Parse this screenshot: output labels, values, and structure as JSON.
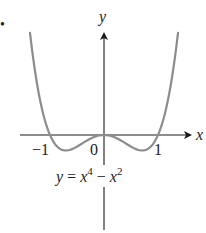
{
  "chart_data": {
    "type": "line",
    "title": "",
    "equation": "y = x^4 − x^2",
    "xlabel": "x",
    "ylabel": "y",
    "x_ticks": [
      "-1",
      "0",
      "1"
    ],
    "xlim": [
      -1.55,
      1.6
    ],
    "ylim": [
      -1.55,
      1.65
    ],
    "grid": false,
    "legend": null,
    "series": [
      {
        "name": "y = x^4 − x^2",
        "x": [
          -1.37,
          -1.2,
          -1.0,
          -0.707,
          -0.4,
          0,
          0.4,
          0.707,
          1.0,
          1.2,
          1.37
        ],
        "y": [
          1.64,
          0.63,
          0,
          -0.25,
          -0.13,
          0,
          -0.13,
          -0.25,
          0,
          0.63,
          1.64
        ]
      }
    ],
    "colors": {
      "curve": "#8c8c8c",
      "axes": "#1a1a1a"
    }
  },
  "labels": {
    "marker": "•",
    "x_axis": "x",
    "y_axis": "y",
    "tick_neg1": "−1",
    "tick_0": "0",
    "tick_1": "1",
    "eq_y": "y",
    "eq_eq": " = ",
    "eq_x1": "x",
    "eq_p1": "4",
    "eq_minus": " − ",
    "eq_x2": "x",
    "eq_p2": "2"
  }
}
